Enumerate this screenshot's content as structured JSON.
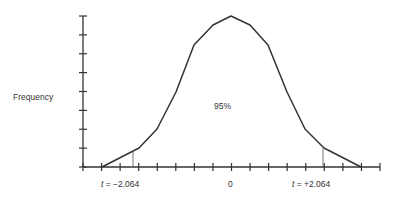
{
  "chart_data": {
    "type": "line",
    "title": "",
    "xlabel": "",
    "ylabel": "Frequency",
    "x_tick_labels": [
      {
        "label": "t = −2.064",
        "value": -2.064
      },
      {
        "label": "0",
        "value": 0
      },
      {
        "label": "t = +2.064",
        "value": 2.064
      }
    ],
    "annotations": [
      {
        "text": "95%",
        "position": "center under curve"
      }
    ],
    "critical_values": [
      -2.064,
      2.064
    ],
    "central_area_percent": 95,
    "x_ticks_count": 17,
    "y_ticks_count": 9,
    "grid": false,
    "legend": null,
    "curve_points_px": [
      [
        102,
        167
      ],
      [
        139,
        148
      ],
      [
        157,
        129
      ],
      [
        176,
        92
      ],
      [
        194,
        45
      ],
      [
        213,
        25
      ],
      [
        231,
        16
      ],
      [
        250,
        25
      ],
      [
        268,
        45
      ],
      [
        287,
        92
      ],
      [
        305,
        129
      ],
      [
        324,
        148
      ],
      [
        361,
        167
      ]
    ]
  },
  "labels": {
    "ylabel": "Frequency",
    "area": "95%",
    "left_t_prefix": "t",
    "left_t_value": " = −2.064",
    "zero": "0",
    "right_t_prefix": "t",
    "right_t_value": " = +2.064"
  },
  "colors": {
    "line": "#333333",
    "background": "#ffffff"
  }
}
